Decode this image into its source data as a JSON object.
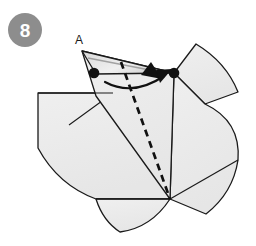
{
  "diagram": {
    "step_badge": {
      "number": "8",
      "fill_color": "#8d8d8d",
      "text_color": "#ffffff",
      "cx": 25,
      "cy": 30,
      "r": 17
    },
    "labels": [
      {
        "name": "vertex-label-a",
        "text": "A",
        "x": 79,
        "y": 44
      }
    ],
    "style": {
      "paper_fill": "#ececec",
      "paper_fill_shadow": "#e2e2e2",
      "outline_color": "#1a1a1a",
      "outline_width": 1.3,
      "crease_width": 1.1,
      "dashed_color": "#111111",
      "dashed_width": 2.6,
      "dash_pattern": "7,5",
      "arrow_color": "#111111",
      "dot_color": "#111111",
      "background": "#ffffff"
    },
    "markers": {
      "dots": [
        {
          "name": "reference-dot-left",
          "cx": 94,
          "cy": 73,
          "r": 5.2
        },
        {
          "name": "reference-dot-right",
          "cx": 174,
          "cy": 73,
          "r": 5.2
        }
      ]
    },
    "annotations": {
      "fold_arrow_curve": "M 105 81 Q 133 96 167 74",
      "fold_arrow_head": "168 69 176 77 160 80",
      "valley_line": "M 121 62 L 170 199",
      "rotate_arrow_head": "150 64 160 78 140 76"
    },
    "shapes": {
      "upper_flap": "M 82 51 L 174 73 L 94 73 Z",
      "left_sector": "M 38 93 L 113 93 L 170 199 L 96 199 Q 58 185 38 148 Z",
      "left_sector_crease": "M 69 125 L 113 93",
      "center_panel": "M 82 51 L 174 73 L 170 199 L 96 96 Z",
      "right_upper_sector": "M 174 73 L 196 44 Q 226 62 238 92 L 205 104 Z",
      "right_lower_sector": "M 170 199 L 205 104 Q 241 120 238 160 Q 234 192 206 214 Z",
      "bottom_sector": "M 96 199 L 170 199 Q 150 228 120 232 Q 104 222 96 199 Z",
      "lower_mid_crease": "M 170 199 L 238 160"
    }
  }
}
